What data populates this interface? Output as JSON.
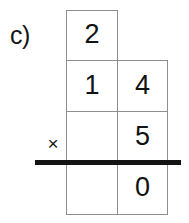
{
  "problem": {
    "label": "c)",
    "operator_symbol": "×",
    "operator_name": "multiplication-times-sign"
  },
  "colors": {
    "ink": "#141414",
    "cell_border": "#8e8e8e",
    "rule": "#141414",
    "paper": "#ffffff"
  },
  "grid": {
    "columns": 2,
    "rows": 4,
    "cells": [
      {
        "row": 1,
        "col": 1,
        "value": "2",
        "filled": true,
        "present": true
      },
      {
        "row": 1,
        "col": 2,
        "value": "",
        "filled": false,
        "present": false
      },
      {
        "row": 2,
        "col": 1,
        "value": "1",
        "filled": true,
        "present": true
      },
      {
        "row": 2,
        "col": 2,
        "value": "4",
        "filled": true,
        "present": true
      },
      {
        "row": 3,
        "col": 1,
        "value": "",
        "filled": false,
        "present": true
      },
      {
        "row": 3,
        "col": 2,
        "value": "5",
        "filled": true,
        "present": true
      },
      {
        "row": 4,
        "col": 1,
        "value": "",
        "filled": false,
        "present": true
      },
      {
        "row": 4,
        "col": 2,
        "value": "0",
        "filled": true,
        "present": true
      }
    ]
  },
  "rule": {
    "name": "answer-rule",
    "visible": true
  }
}
